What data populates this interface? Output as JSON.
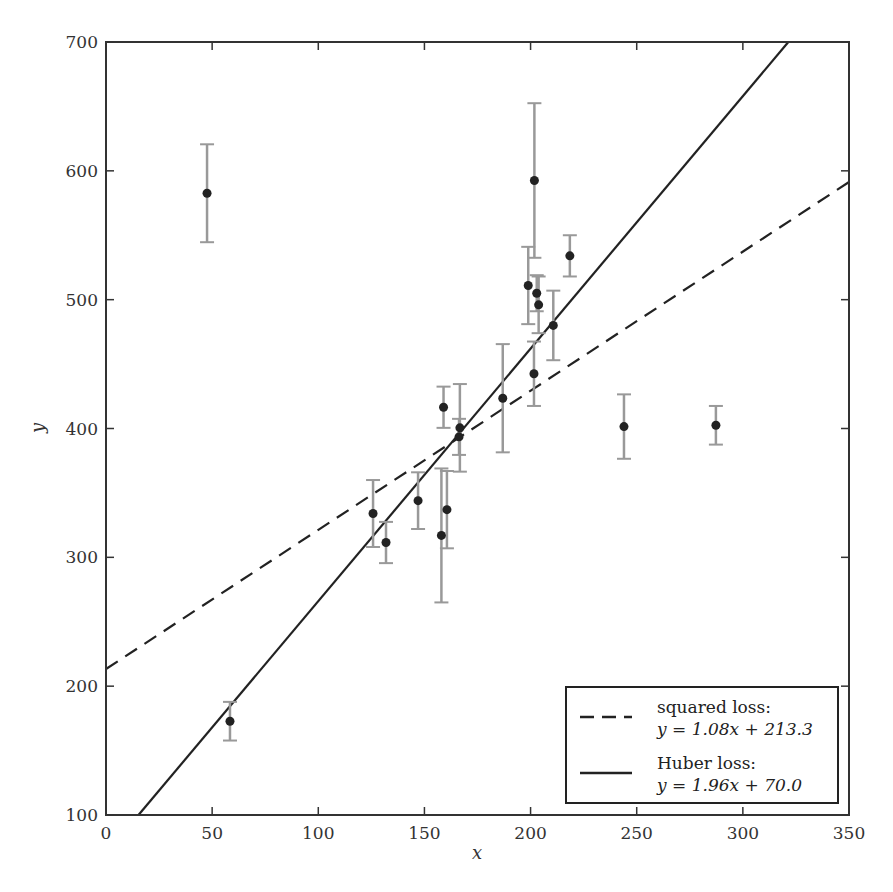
{
  "chart_data": {
    "type": "scatter",
    "title": "",
    "xlabel": "x",
    "ylabel": "y",
    "xlim": [
      0,
      350
    ],
    "ylim": [
      100,
      700
    ],
    "xticks": [
      0,
      50,
      100,
      150,
      200,
      250,
      300,
      350
    ],
    "yticks": [
      100,
      200,
      300,
      400,
      500,
      600,
      700
    ],
    "grid": false,
    "legend_position": "lower right",
    "points": [
      {
        "x": 47.6,
        "y": 582.6,
        "err": 38
      },
      {
        "x": 58.4,
        "y": 172.8,
        "err": 15
      },
      {
        "x": 125.8,
        "y": 334.0,
        "err": 26
      },
      {
        "x": 131.9,
        "y": 311.5,
        "err": 16
      },
      {
        "x": 147.0,
        "y": 344.0,
        "err": 22
      },
      {
        "x": 158.0,
        "y": 317.0,
        "err": 52
      },
      {
        "x": 159.0,
        "y": 416.5,
        "err": 16
      },
      {
        "x": 160.6,
        "y": 337.0,
        "err": 30
      },
      {
        "x": 166.3,
        "y": 393.5,
        "err": 14
      },
      {
        "x": 166.7,
        "y": 400.5,
        "err": 34
      },
      {
        "x": 186.9,
        "y": 423.5,
        "err": 42
      },
      {
        "x": 198.9,
        "y": 511.0,
        "err": 30
      },
      {
        "x": 201.6,
        "y": 442.5,
        "err": 25
      },
      {
        "x": 201.8,
        "y": 592.5,
        "err": 60
      },
      {
        "x": 202.9,
        "y": 505.0,
        "err": 14
      },
      {
        "x": 203.8,
        "y": 496.0,
        "err": 22
      },
      {
        "x": 210.7,
        "y": 480.0,
        "err": 27
      },
      {
        "x": 218.5,
        "y": 534.0,
        "err": 16
      },
      {
        "x": 244.0,
        "y": 401.5,
        "err": 25
      },
      {
        "x": 287.3,
        "y": 402.5,
        "err": 15
      }
    ],
    "series": [
      {
        "name": "squared loss",
        "equation": "y = 1.08x + 213.3",
        "slope": 1.08,
        "intercept": 213.3,
        "style": "dashed"
      },
      {
        "name": "Huber loss",
        "equation": "y = 1.96x + 70.0",
        "slope": 1.96,
        "intercept": 70.0,
        "style": "solid"
      }
    ],
    "legend": [
      {
        "line1": "squared loss:",
        "line2": "y = 1.08x + 213.3",
        "style": "dashed"
      },
      {
        "line1": "Huber loss:",
        "line2": "y = 1.96x + 70.0",
        "style": "solid"
      }
    ],
    "colors": {
      "points": "#222222",
      "errorbars": "#999999",
      "lines": "#222222",
      "axes": "#333333"
    }
  }
}
